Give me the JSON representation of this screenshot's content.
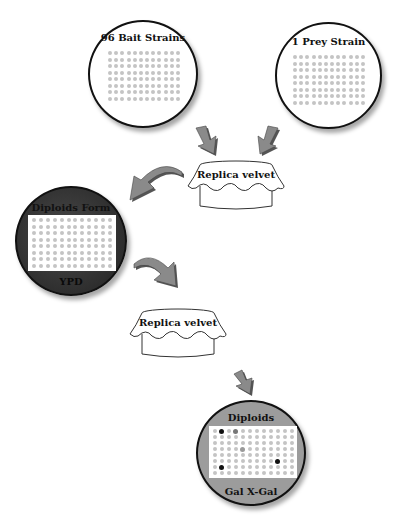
{
  "diagram": {
    "type": "yeast-mating-workflow",
    "plates": {
      "bait": {
        "title": "96 Bait Strains",
        "rows": 8,
        "cols": 12,
        "background": "#ffffff"
      },
      "prey": {
        "title": "1 Prey Strain",
        "rows": 8,
        "cols": 12,
        "background": "#ffffff"
      },
      "diploid": {
        "title": "Diploids Form",
        "footer": "YPD",
        "rows": 8,
        "cols": 12,
        "background": "#3a3a3a"
      },
      "selection": {
        "title": "Diploids",
        "footer": "Gal X-Gal",
        "rows": 8,
        "cols": 12,
        "background": "#9a9a9a",
        "positive_colonies": [
          {
            "row": 0,
            "col": 1,
            "color": "#111111"
          },
          {
            "row": 0,
            "col": 3,
            "color": "#777777"
          },
          {
            "row": 3,
            "col": 4,
            "color": "#9a9a9a"
          },
          {
            "row": 6,
            "col": 1,
            "color": "#111111"
          },
          {
            "row": 5,
            "col": 9,
            "color": "#111111"
          }
        ]
      }
    },
    "velvets": [
      {
        "label": "Replica velvet"
      },
      {
        "label": "Replica velvet"
      }
    ],
    "arrows": [
      {
        "from": "bait",
        "to": "velvet-1"
      },
      {
        "from": "prey",
        "to": "velvet-1"
      },
      {
        "from": "velvet-1",
        "to": "diploid"
      },
      {
        "from": "diploid",
        "to": "velvet-2"
      },
      {
        "from": "velvet-2",
        "to": "selection"
      }
    ],
    "colors": {
      "arrow": "#8a8a8a",
      "arrow_shadow": "#555555",
      "outline": "#111111"
    }
  }
}
